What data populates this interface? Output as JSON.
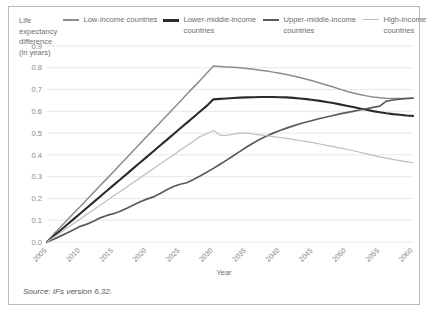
{
  "figure": {
    "y_axis_title": "Life expectancy difference (in years)",
    "x_axis_title": "Year",
    "source_note": "Source: IFs version 6.32."
  },
  "legend": {
    "items": [
      {
        "label": "Low-income countries",
        "color": "#8c8c8c"
      },
      {
        "label": "Lower-middle-income countries",
        "color": "#2b2b2b"
      },
      {
        "label": "Upper-middle-income countries",
        "color": "#5a5a5a"
      },
      {
        "label": "High-income countries",
        "color": "#bdbdbd"
      }
    ]
  },
  "chart_data": {
    "type": "line",
    "title": "",
    "xlabel": "Year",
    "ylabel": "Life expectancy difference (in years)",
    "xlim": [
      2005,
      2060
    ],
    "ylim": [
      0.0,
      0.9
    ],
    "grid": true,
    "legend_position": "top",
    "annotation": "Source: IFs version 6.32.",
    "ytick_labels": [
      "0.0",
      "0.1",
      "0.2",
      "0.3",
      "0.4",
      "0.5",
      "0.6",
      "0.7",
      "0.8",
      "0.9"
    ],
    "ytick_values": [
      0.0,
      0.1,
      0.2,
      0.3,
      0.4,
      0.5,
      0.6,
      0.7,
      0.8,
      0.9
    ],
    "xtick_labels": [
      "2005",
      "2010",
      "2015",
      "2020",
      "2025",
      "2030",
      "2035",
      "2040",
      "2045",
      "2050",
      "2055",
      "2060"
    ],
    "x": [
      2005,
      2006,
      2007,
      2008,
      2009,
      2010,
      2011,
      2012,
      2013,
      2014,
      2015,
      2016,
      2017,
      2018,
      2019,
      2020,
      2021,
      2022,
      2023,
      2024,
      2025,
      2026,
      2027,
      2028,
      2029,
      2030,
      2031,
      2032,
      2033,
      2034,
      2035,
      2036,
      2037,
      2038,
      2039,
      2040,
      2041,
      2042,
      2043,
      2044,
      2045,
      2046,
      2047,
      2048,
      2049,
      2050,
      2051,
      2052,
      2053,
      2054,
      2055,
      2056,
      2057,
      2058,
      2059,
      2060
    ],
    "series": [
      {
        "name": "Low-income countries",
        "color": "#8c8c8c",
        "values": [
          0.0,
          0.035,
          0.068,
          0.1,
          0.132,
          0.163,
          0.195,
          0.227,
          0.259,
          0.291,
          0.323,
          0.356,
          0.388,
          0.42,
          0.452,
          0.484,
          0.517,
          0.549,
          0.581,
          0.613,
          0.645,
          0.678,
          0.71,
          0.742,
          0.775,
          0.808,
          0.806,
          0.804,
          0.802,
          0.8,
          0.797,
          0.793,
          0.789,
          0.785,
          0.78,
          0.775,
          0.769,
          0.762,
          0.755,
          0.747,
          0.739,
          0.73,
          0.721,
          0.712,
          0.702,
          0.692,
          0.684,
          0.677,
          0.671,
          0.666,
          0.662,
          0.66,
          0.659,
          0.659,
          0.659,
          0.66
        ]
      },
      {
        "name": "Lower-middle-income countries",
        "color": "#2b2b2b",
        "values": [
          0.0,
          0.027,
          0.053,
          0.079,
          0.105,
          0.131,
          0.157,
          0.183,
          0.209,
          0.235,
          0.261,
          0.287,
          0.313,
          0.339,
          0.365,
          0.391,
          0.417,
          0.443,
          0.469,
          0.495,
          0.521,
          0.547,
          0.573,
          0.599,
          0.625,
          0.655,
          0.657,
          0.659,
          0.661,
          0.663,
          0.664,
          0.665,
          0.666,
          0.666,
          0.666,
          0.665,
          0.664,
          0.662,
          0.659,
          0.656,
          0.652,
          0.648,
          0.643,
          0.638,
          0.632,
          0.626,
          0.62,
          0.613,
          0.607,
          0.601,
          0.596,
          0.591,
          0.587,
          0.584,
          0.581,
          0.579
        ]
      },
      {
        "name": "Upper-middle-income countries",
        "color": "#5a5a5a",
        "values": [
          0.0,
          0.013,
          0.027,
          0.041,
          0.056,
          0.072,
          0.082,
          0.095,
          0.111,
          0.122,
          0.13,
          0.141,
          0.155,
          0.17,
          0.185,
          0.197,
          0.207,
          0.223,
          0.24,
          0.255,
          0.265,
          0.272,
          0.287,
          0.303,
          0.32,
          0.338,
          0.357,
          0.376,
          0.396,
          0.416,
          0.436,
          0.455,
          0.472,
          0.487,
          0.5,
          0.512,
          0.523,
          0.533,
          0.543,
          0.551,
          0.559,
          0.567,
          0.574,
          0.581,
          0.588,
          0.594,
          0.6,
          0.606,
          0.612,
          0.618,
          0.624,
          0.647,
          0.652,
          0.656,
          0.659,
          0.661
        ]
      },
      {
        "name": "High-income countries",
        "color": "#bdbdbd",
        "values": [
          0.0,
          0.022,
          0.043,
          0.064,
          0.085,
          0.106,
          0.127,
          0.148,
          0.169,
          0.19,
          0.211,
          0.232,
          0.253,
          0.274,
          0.295,
          0.316,
          0.337,
          0.358,
          0.379,
          0.4,
          0.421,
          0.442,
          0.463,
          0.484,
          0.498,
          0.512,
          0.491,
          0.489,
          0.495,
          0.5,
          0.5,
          0.496,
          0.492,
          0.488,
          0.484,
          0.48,
          0.476,
          0.471,
          0.466,
          0.461,
          0.456,
          0.45,
          0.444,
          0.438,
          0.432,
          0.426,
          0.419,
          0.412,
          0.405,
          0.398,
          0.391,
          0.385,
          0.379,
          0.374,
          0.369,
          0.364
        ]
      }
    ]
  }
}
